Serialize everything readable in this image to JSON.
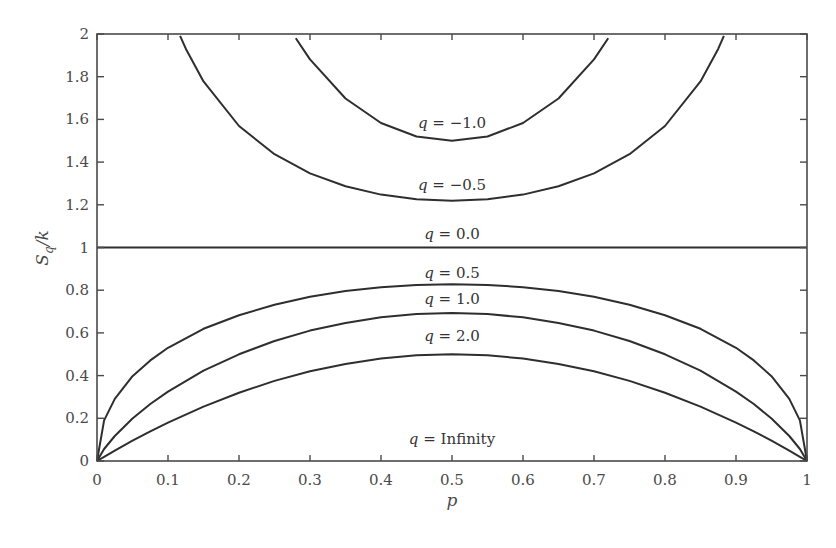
{
  "chart_data": {
    "type": "line",
    "title": "",
    "xlabel": "p",
    "ylabel": "S_q/k",
    "xlim": [
      0,
      1
    ],
    "ylim": [
      0,
      2
    ],
    "grid": false,
    "legend": "inline curve labels",
    "x_ticks": [
      "0",
      "0.1",
      "0.2",
      "0.3",
      "0.4",
      "0.5",
      "0.6",
      "0.7",
      "0.8",
      "0.9",
      "1"
    ],
    "y_ticks": [
      "0",
      "0.2",
      "0.4",
      "0.6",
      "0.8",
      "1",
      "1.2",
      "1.4",
      "1.6",
      "1.8",
      "2"
    ],
    "x": [
      0,
      0.01,
      0.025,
      0.05,
      0.075,
      0.1,
      0.15,
      0.2,
      0.25,
      0.3,
      0.35,
      0.4,
      0.45,
      0.5,
      0.55,
      0.6,
      0.65,
      0.7,
      0.75,
      0.8,
      0.85,
      0.9,
      0.925,
      0.95,
      0.975,
      0.99,
      1
    ],
    "series": [
      {
        "name": "q = -1.0",
        "label": "q = −1.0",
        "label_pos": [
          0.5,
          1.56
        ],
        "x": [
          0.28,
          0.3,
          0.35,
          0.4,
          0.45,
          0.5,
          0.55,
          0.6,
          0.65,
          0.7,
          0.72
        ],
        "values": [
          1.98,
          1.881,
          1.698,
          1.583,
          1.52,
          1.5,
          1.52,
          1.583,
          1.698,
          1.881,
          1.98
        ]
      },
      {
        "name": "q = -0.5",
        "label": "q = −0.5",
        "label_pos": [
          0.5,
          1.27
        ],
        "x": [
          0.117,
          0.125,
          0.15,
          0.2,
          0.25,
          0.3,
          0.35,
          0.4,
          0.45,
          0.5,
          0.55,
          0.6,
          0.65,
          0.7,
          0.75,
          0.8,
          0.85,
          0.875,
          0.883
        ],
        "values": [
          1.991,
          1.931,
          1.778,
          1.569,
          1.437,
          1.347,
          1.287,
          1.248,
          1.226,
          1.219,
          1.226,
          1.248,
          1.287,
          1.347,
          1.437,
          1.569,
          1.778,
          1.931,
          1.991
        ]
      },
      {
        "name": "q = 0.0",
        "label": "q = 0.0",
        "label_pos": [
          0.5,
          1.04
        ],
        "x": [
          0,
          1
        ],
        "values": [
          1,
          1
        ]
      },
      {
        "name": "q = 0.5",
        "label": "q = 0.5",
        "label_pos": [
          0.5,
          0.855
        ],
        "values": [
          0,
          0.19,
          0.291,
          0.397,
          0.471,
          0.53,
          0.619,
          0.683,
          0.732,
          0.769,
          0.796,
          0.814,
          0.825,
          0.828,
          0.825,
          0.814,
          0.796,
          0.769,
          0.732,
          0.683,
          0.619,
          0.53,
          0.471,
          0.397,
          0.291,
          0.19,
          0
        ]
      },
      {
        "name": "q = 1.0",
        "label": "q = 1.0",
        "label_pos": [
          0.5,
          0.735
        ],
        "values": [
          0,
          0.056,
          0.117,
          0.199,
          0.267,
          0.325,
          0.423,
          0.5,
          0.562,
          0.611,
          0.647,
          0.673,
          0.688,
          0.693,
          0.688,
          0.673,
          0.647,
          0.611,
          0.562,
          0.5,
          0.423,
          0.325,
          0.267,
          0.199,
          0.117,
          0.056,
          0
        ]
      },
      {
        "name": "q = 2.0",
        "label": "q = 2.0",
        "label_pos": [
          0.5,
          0.56
        ],
        "values": [
          0,
          0.0198,
          0.0488,
          0.095,
          0.139,
          0.18,
          0.255,
          0.32,
          0.375,
          0.42,
          0.455,
          0.48,
          0.495,
          0.5,
          0.495,
          0.48,
          0.455,
          0.42,
          0.375,
          0.32,
          0.255,
          0.18,
          0.139,
          0.095,
          0.0488,
          0.0198,
          0
        ]
      },
      {
        "name": "q = Infinity",
        "label": "q = Infinity",
        "label_pos": [
          0.5,
          0.08
        ],
        "x": [
          0,
          1
        ],
        "values": [
          0,
          0
        ],
        "hidden_line": true
      }
    ]
  },
  "colors": {
    "curve": "#2e2e2e",
    "axis": "#4a4a4a",
    "background": "#ffffff"
  }
}
